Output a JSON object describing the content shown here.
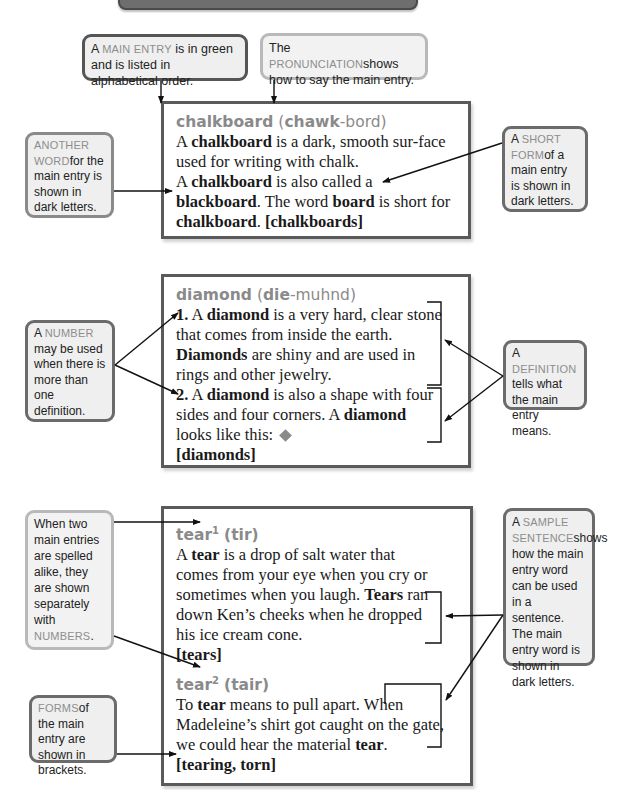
{
  "banner": {
    "label": ""
  },
  "callouts": {
    "main_entry": {
      "sc": "Main entry",
      "text": " is in green and is listed in alphabetical order.",
      "prefix": "A "
    },
    "pronunciation": {
      "prefix": "The ",
      "sc": "Pronunciation",
      "text": "shows how to say the main entry."
    },
    "another_word": {
      "sc": "Another word",
      "text": "for the main entry is shown in dark letters."
    },
    "short_form": {
      "prefix": "A ",
      "sc": "Short form",
      "text": "of a main entry is shown in dark letters."
    },
    "number": {
      "prefix": "A ",
      "sc": "Number",
      "text": " may be used when there is more than one definition."
    },
    "definition": {
      "prefix": "A ",
      "sc": "Definition",
      "text": " tells what the main entry means."
    },
    "homographs": {
      "text": "When two main entries are spelled alike, they are shown separately with ",
      "sc": "Numbers",
      "suffix": "."
    },
    "sample_sentence": {
      "prefix": "A ",
      "sc": "Sample sentence",
      "text": "shows how the main entry word can be used in a sentence. The main entry word is shown in dark letters."
    },
    "forms": {
      "sc": "Forms",
      "text": "of the main entry are shown in brackets."
    }
  },
  "entries": {
    "chalkboard": {
      "headword": "chalkboard",
      "pron_open": "(",
      "pron_stress": "chawk",
      "pron_rest": "-bord)",
      "t1": "A ",
      "b1": "chalkboard",
      "t2": " is a dark, smooth sur-face used for writing with chalk.",
      "t3": "A ",
      "b2": "chalkboard",
      "t4": " is also called a ",
      "b3": "blackboard",
      "t5": ". The word ",
      "b4": "board",
      "t6": " is short for ",
      "b5": "chalkboard",
      "t7": ". ",
      "forms": "[chalkboards]"
    },
    "diamond": {
      "headword": "diamond",
      "pron_open": "(",
      "pron_stress": "die",
      "pron_rest": "-muhnd)",
      "n1": "1.",
      "t1": " A ",
      "b1": "diamond",
      "t2": " is a very hard, clear stone that comes from inside the earth. ",
      "b2": "Diamonds",
      "t3": " are shiny and are used in rings and other jewelry.",
      "n2": "2.",
      "t4": " A ",
      "b3": "diamond",
      "t5": " is also a shape with four sides and four corners. A ",
      "b4": "diamond",
      "t6": " looks like this:",
      "forms": "[diamonds]"
    },
    "tear1": {
      "headword": "tear",
      "sup": "1",
      "pron": "(tir)",
      "t1": "A ",
      "b1": "tear",
      "t2": " is a drop of salt water that comes from your eye when you cry or sometimes when you laugh. ",
      "b2": "Tears",
      "t3": " ran down Ken’s cheeks when he dropped his ice cream cone.",
      "forms": "[tears]"
    },
    "tear2": {
      "headword": "tear",
      "sup": "2",
      "pron": "(tair)",
      "t1": "To ",
      "b1": "tear",
      "t2": " means to pull apart. When Madeleine’s shirt got caught on the gate, we could hear the material ",
      "b2": "tear",
      "t3": ". ",
      "forms": "[tearing, torn]"
    }
  },
  "colors": {
    "headword": "#8a8a8a",
    "callout_border": "#6b6b6b",
    "callout_bg": "#efefef",
    "entry_border": "#5a5a5a"
  }
}
